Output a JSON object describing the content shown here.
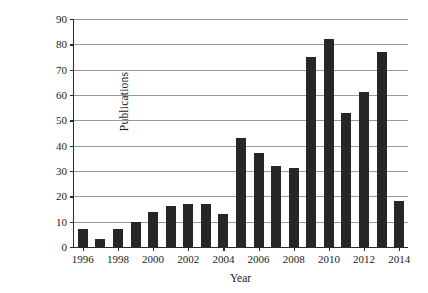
{
  "chart_data": {
    "type": "bar",
    "title": "",
    "xlabel": "Year",
    "ylabel": "Publications",
    "categories": [
      "1996",
      "1997",
      "1998",
      "1999",
      "2000",
      "2001",
      "2002",
      "2003",
      "2004",
      "2005",
      "2006",
      "2007",
      "2008",
      "2009",
      "2010",
      "2011",
      "2012",
      "2013",
      "2014"
    ],
    "values": [
      7,
      3,
      7,
      10,
      14,
      16,
      17,
      17,
      13,
      43,
      37,
      32,
      31,
      75,
      82,
      53,
      61,
      77,
      18
    ],
    "ylim": [
      0,
      90
    ],
    "ytick_labels": [
      "0",
      "10",
      "20",
      "30",
      "40",
      "50",
      "60",
      "70",
      "80",
      "90"
    ],
    "ytick_values": [
      0,
      10,
      20,
      30,
      40,
      50,
      60,
      70,
      80,
      90
    ],
    "xtick_labels": [
      "1996",
      "1998",
      "2000",
      "2002",
      "2004",
      "2006",
      "2008",
      "2010",
      "2012",
      "2014"
    ],
    "grid": "horizontal",
    "legend": "none",
    "bar_color": "#262626",
    "grid_color": "#9a9a9a",
    "axis_color": "#2b2b2b"
  }
}
